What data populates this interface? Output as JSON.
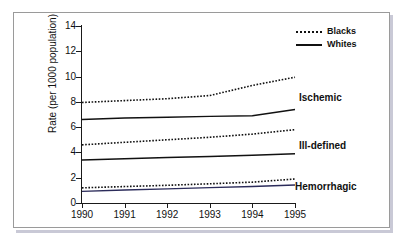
{
  "chart_data": {
    "type": "line",
    "title": "",
    "xlabel": "",
    "ylabel": "Rate (per 1000 population)",
    "x": [
      1990,
      1991,
      1992,
      1993,
      1994,
      1995
    ],
    "xtick_labels": [
      "1990",
      "1991",
      "1992",
      "1993",
      "1994",
      "1995"
    ],
    "ytick_labels": [
      "0",
      "2",
      "4",
      "6",
      "8",
      "10",
      "12",
      "14"
    ],
    "yticks": [
      0,
      2,
      4,
      6,
      8,
      10,
      12,
      14
    ],
    "ylim": [
      0,
      14
    ],
    "xlim": [
      1990,
      1995
    ],
    "grid": false,
    "legend_position": "top-right",
    "series": [
      {
        "name": "Ischemic - Blacks",
        "style": "dotted",
        "color": "#111111",
        "values": [
          7.95,
          8.1,
          8.25,
          8.5,
          9.3,
          9.95
        ]
      },
      {
        "name": "Ischemic - Whites",
        "style": "solid",
        "color": "#111111",
        "values": [
          6.6,
          6.72,
          6.78,
          6.85,
          6.9,
          7.4
        ]
      },
      {
        "name": "Ill-defined - Blacks",
        "style": "dotted",
        "color": "#111111",
        "values": [
          4.6,
          4.8,
          5.0,
          5.2,
          5.45,
          5.8
        ]
      },
      {
        "name": "Ill-defined - Whites",
        "style": "solid",
        "color": "#111111",
        "values": [
          3.4,
          3.5,
          3.6,
          3.68,
          3.78,
          3.9
        ]
      },
      {
        "name": "Hemorrhagic - Blacks",
        "style": "dotted",
        "color": "#111111",
        "values": [
          1.2,
          1.3,
          1.4,
          1.52,
          1.65,
          1.9
        ]
      },
      {
        "name": "Hemorrhagic - Whites",
        "style": "solid",
        "color": "#2b2b5a",
        "values": [
          0.92,
          1.03,
          1.12,
          1.22,
          1.3,
          1.42
        ]
      }
    ],
    "legend": [
      {
        "label": "Blacks",
        "style": "dotted"
      },
      {
        "label": "Whites",
        "style": "solid"
      }
    ],
    "annotations": [
      {
        "label": "Ischemic",
        "value": 8.6
      },
      {
        "label": "Ill-defined",
        "value": 4.9
      },
      {
        "label": "Hemorrhagic",
        "value": 1.75
      }
    ]
  }
}
